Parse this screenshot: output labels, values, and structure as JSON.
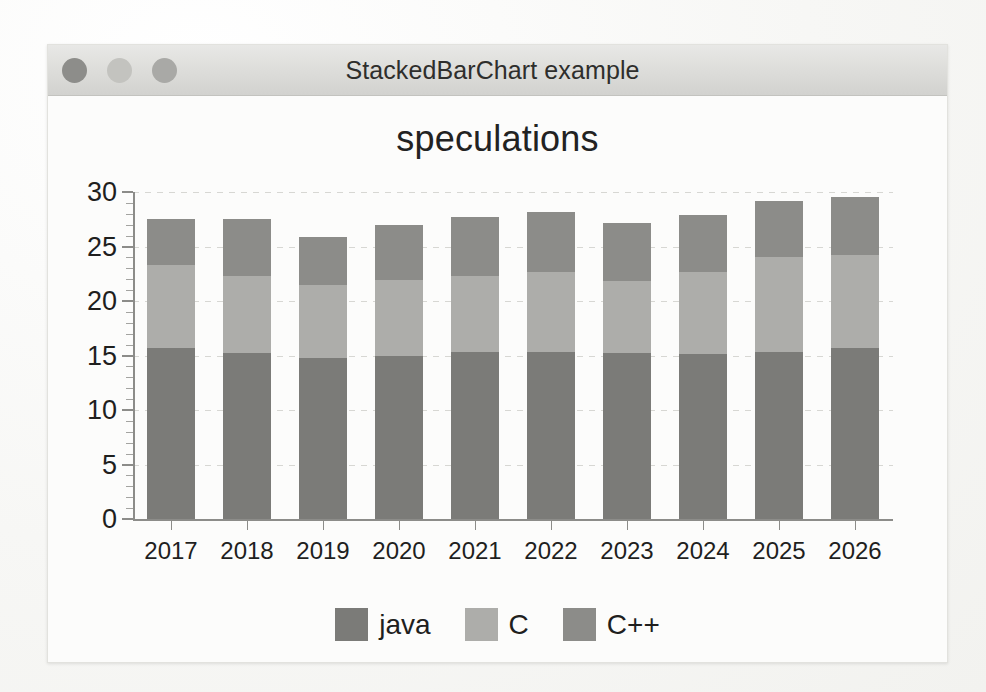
{
  "window": {
    "title": "StackedBarChart example",
    "controls": [
      {
        "name": "close-button",
        "color": "#8d8d8a"
      },
      {
        "name": "minimize-button",
        "color": "#c3c3bf"
      },
      {
        "name": "zoom-button",
        "color": "#a9a9a6"
      }
    ]
  },
  "chart_data": {
    "type": "bar",
    "stacked": true,
    "title": "speculations",
    "xlabel": "",
    "ylabel": "",
    "ylim": [
      0,
      30
    ],
    "yticks": [
      0,
      5,
      10,
      15,
      20,
      25,
      30
    ],
    "ytick_labels": [
      "0",
      "5",
      "10",
      "15",
      "20",
      "25",
      "30"
    ],
    "minor_tick_step": 1,
    "grid": true,
    "grid_style": "dashed",
    "legend_position": "bottom",
    "categories": [
      "2017",
      "2018",
      "2019",
      "2020",
      "2021",
      "2022",
      "2023",
      "2024",
      "2025",
      "2026"
    ],
    "series": [
      {
        "name": "java",
        "color": "#7b7b78",
        "values": [
          15.7,
          15.2,
          14.8,
          15.0,
          15.3,
          15.3,
          15.2,
          15.1,
          15.3,
          15.7
        ]
      },
      {
        "name": "C",
        "color": "#adadaa",
        "values": [
          7.6,
          7.1,
          6.7,
          6.9,
          7.0,
          7.4,
          6.6,
          7.6,
          8.7,
          8.5
        ]
      },
      {
        "name": "C++",
        "color": "#8c8c89",
        "values": [
          4.2,
          5.2,
          4.4,
          5.1,
          5.4,
          5.5,
          5.4,
          5.2,
          5.2,
          5.3
        ]
      }
    ],
    "totals": [
      27.5,
      27.5,
      25.9,
      27.0,
      27.7,
      28.2,
      27.2,
      27.9,
      29.2,
      29.5
    ]
  }
}
